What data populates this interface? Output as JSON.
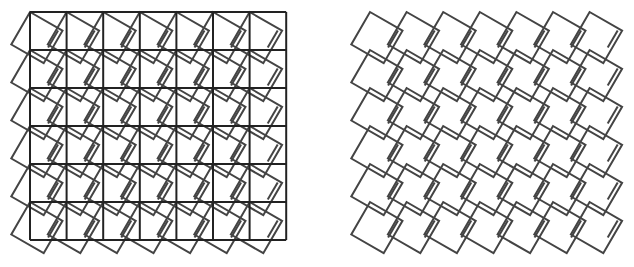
{
  "figure": {
    "panels": [
      {
        "id": "left",
        "label": "rotated squares overlaid on square grid",
        "show_grid": true,
        "origin": [
          30,
          12
        ],
        "cols": 7,
        "rows": 6,
        "cell_w": 36.6,
        "cell_h": 38.0,
        "rotation_deg": 30,
        "square_side": 37.5
      },
      {
        "id": "right",
        "label": "rotated squares without grid",
        "show_grid": false,
        "origin": [
          370,
          12
        ],
        "cols": 7,
        "rows": 6,
        "cell_w": 36.6,
        "cell_h": 38.0,
        "rotation_deg": 30,
        "square_side": 37.5
      }
    ],
    "colors": {
      "grid": "#222222",
      "square": "#444444",
      "background": "#ffffff"
    }
  }
}
